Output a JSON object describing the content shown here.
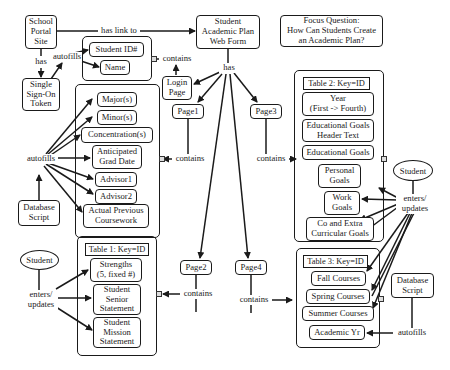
{
  "diagram": {
    "type": "concept-map",
    "focus_question": "Focus Question:\nHow Can Students Create\nan Academic Plan?",
    "nodes": {
      "school_portal": "School\nPortal\nSite",
      "sso_token": "Single\nSign-On\nToken",
      "web_form": "Student\nAcademic Plan\nWeb Form",
      "student_id": "Student ID#",
      "name": "Name",
      "login_page": "Login\nPage",
      "page1": "Page1",
      "page2": "Page2",
      "page3": "Page3",
      "page4": "Page4",
      "major": "Major(s)",
      "minor": "Minor(s)",
      "concentration": "Concentration(s)",
      "grad_date": "Anticipated\nGrad Date",
      "advisor1": "Advisor1",
      "advisor2": "Advisor2",
      "prev_coursework": "Actual Previous\nCoursework",
      "db_script_left": "Database\nScript",
      "db_script_right": "Database\nScript",
      "student_left": "Student",
      "student_right": "Student",
      "table1_header": "Table 1: Key=ID",
      "strengths": "Strengths\n(5, fixed #)",
      "senior_statement": "Student\nSenior\nStatement",
      "mission_statement": "Student\nMission\nStatement",
      "table2_header": "Table 2: Key=ID",
      "year": "Year\n(First -> Fourth)",
      "edu_goals_header": "Educational Goals\nHeader Text",
      "edu_goals": "Educational Goals",
      "personal_goals": "Personal\nGoals",
      "work_goals": "Work\nGoals",
      "co_extra_goals": "Co and Extra\nCurricular Goals",
      "table3_header": "Table 3: Key=ID",
      "fall": "Fall Courses",
      "spring": "Spring Courses",
      "summer": "Summer Courses",
      "academic_yr": "Academic Yr"
    },
    "link_labels": {
      "has_link_to": "has link to",
      "has_left": "has",
      "autofills_sso": "autofills",
      "contains_login": "contains",
      "has_center": "has",
      "autofills_left": "autofills",
      "contains_page1": "contains",
      "contains_page3": "contains",
      "contains_page2": "contains",
      "contains_page4": "contains",
      "enters_updates_left": "enters/\nupdates",
      "enters_updates_right": "enters/\nupdates",
      "autofills_right": "autofills"
    }
  }
}
